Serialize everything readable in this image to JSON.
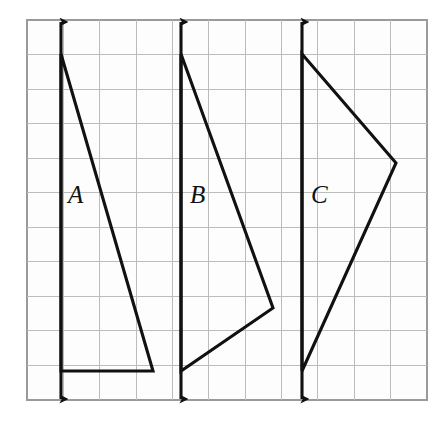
{
  "figure": {
    "background_color": "#ffffff",
    "grid": {
      "border_color": "#9a9a9a",
      "line_color": "#bcbcbc",
      "cell_size": 34.5,
      "columns": 11,
      "rows": 11,
      "x0": 27,
      "y0": 20,
      "x1": 427,
      "y1": 400
    },
    "stroke_color": "#111111",
    "shapes": [
      {
        "label": "A",
        "label_x": 68,
        "label_y": 203,
        "kind": "triangle",
        "vertices": [
          {
            "x": 61,
            "y": 54
          },
          {
            "x": 153,
            "y": 371
          },
          {
            "x": 61,
            "y": 371
          }
        ],
        "axis": {
          "x": 61,
          "top_y": 22,
          "bottom_y": 399
        },
        "axis_name": "vertical-arrow-a"
      },
      {
        "label": "B",
        "label_x": 190,
        "label_y": 203,
        "kind": "quadrilateral",
        "vertices": [
          {
            "x": 181,
            "y": 54
          },
          {
            "x": 273,
            "y": 308
          },
          {
            "x": 181,
            "y": 371
          }
        ],
        "axis": {
          "x": 181,
          "top_y": 22,
          "bottom_y": 399
        },
        "axis_name": "vertical-arrow-b"
      },
      {
        "label": "C",
        "label_x": 311,
        "label_y": 203,
        "kind": "quadrilateral",
        "vertices": [
          {
            "x": 302,
            "y": 54
          },
          {
            "x": 396,
            "y": 163
          },
          {
            "x": 302,
            "y": 371
          }
        ],
        "axis": {
          "x": 302,
          "top_y": 22,
          "bottom_y": 399
        },
        "axis_name": "vertical-arrow-c"
      }
    ]
  }
}
